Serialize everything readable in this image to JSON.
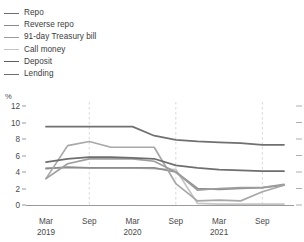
{
  "chart_data": {
    "type": "line",
    "title": "",
    "subtitle": "",
    "xlabel": "",
    "ylabel": "%",
    "ylim": [
      0,
      12
    ],
    "yticks": [
      0,
      2,
      4,
      6,
      8,
      10,
      12
    ],
    "grid": false,
    "legend_position": "top-left",
    "x": [
      "Mar 2019",
      "Jun 2019",
      "Sep 2019",
      "Dec 2019",
      "Mar 2020",
      "Jun 2020",
      "Sep 2020",
      "Dec 2020",
      "Mar 2021",
      "Jun 2021",
      "Sep 2021",
      "Dec 2021"
    ],
    "xticks": [
      "Mar 2019",
      "Sep",
      "Mar 2020",
      "Sep",
      "Mar 2021",
      "Sep"
    ],
    "annotations": [
      "dashed vertical reference lines at Sep 2019, Sep 2020 and Sep 2021"
    ],
    "series": [
      {
        "name": "Repo",
        "color": "#9e9e9e",
        "values": [
          3.2,
          5.0,
          5.6,
          5.6,
          5.6,
          5.3,
          4.0,
          1.8,
          2.0,
          2.1,
          2.1,
          2.5
        ]
      },
      {
        "name": "Reverse repo",
        "color": "#a8a8a8",
        "values": [
          3.2,
          7.2,
          7.7,
          7.0,
          7.0,
          7.0,
          2.6,
          0.5,
          0.6,
          0.5,
          1.6,
          2.4
        ]
      },
      {
        "name": "91-day Treasury bill",
        "color": "#8c8c8c",
        "values": [
          4.4,
          4.6,
          4.5,
          4.5,
          4.5,
          4.5,
          4.0,
          2.0,
          1.9,
          2.0,
          2.1,
          2.4
        ]
      },
      {
        "name": "Call money",
        "color": "#c4c4c4",
        "values": [
          4.5,
          4.5,
          4.5,
          4.5,
          4.5,
          4.4,
          4.3,
          0.2,
          0.1,
          0.1,
          0.1,
          0.1
        ]
      },
      {
        "name": "Deposit",
        "color": "#6e6e6e",
        "values": [
          5.2,
          5.6,
          5.8,
          5.8,
          5.7,
          5.6,
          4.8,
          4.5,
          4.3,
          4.2,
          4.1,
          4.1
        ]
      },
      {
        "name": "Lending",
        "color": "#707070",
        "values": [
          9.5,
          9.5,
          9.5,
          9.5,
          9.5,
          8.4,
          7.9,
          7.7,
          7.6,
          7.5,
          7.3,
          7.3
        ]
      }
    ]
  },
  "legend": {
    "items": [
      {
        "label": "Repo",
        "color": "#6e6e6e"
      },
      {
        "label": "Reverse repo",
        "color": "#8a8a8a"
      },
      {
        "label": "91-day Treasury bill",
        "color": "#9a9a9a"
      },
      {
        "label": "Call money",
        "color": "#c4c4c4"
      },
      {
        "label": "Deposit",
        "color": "#5e5e5e"
      },
      {
        "label": "Lending",
        "color": "#6e6e6e"
      }
    ]
  },
  "axes": {
    "y_unit": "%",
    "y_ticks": [
      "12",
      "10",
      "8",
      "6",
      "4",
      "2",
      "0"
    ],
    "x_ticks": [
      {
        "month": "Mar",
        "year": "2019"
      },
      {
        "month": "Sep",
        "year": ""
      },
      {
        "month": "Mar",
        "year": "2020"
      },
      {
        "month": "Sep",
        "year": ""
      },
      {
        "month": "Mar",
        "year": "2021"
      },
      {
        "month": "Sep",
        "year": ""
      }
    ]
  }
}
